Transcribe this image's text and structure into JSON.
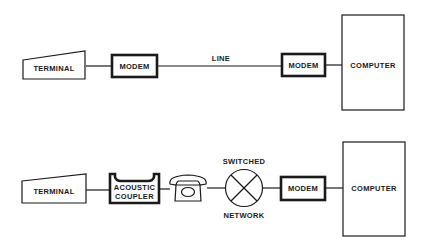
{
  "diagram": {
    "top_row": {
      "terminal": {
        "label": "TERMINAL"
      },
      "modem_left": {
        "label": "MODEM"
      },
      "line": {
        "label": "LINE"
      },
      "modem_right": {
        "label": "MODEM"
      },
      "computer": {
        "label": "COMPUTER"
      }
    },
    "bottom_row": {
      "terminal": {
        "label": "TERMINAL"
      },
      "acoustic_coupler": {
        "label_line1": "ACOUSTIC",
        "label_line2": "COUPLER"
      },
      "telephone": {
        "icon": "telephone-icon"
      },
      "switched_network": {
        "label_top": "SWITCHED",
        "label_bottom": "NETWORK",
        "icon": "circle-x-icon"
      },
      "modem": {
        "label": "MODEM"
      },
      "computer": {
        "label": "COMPUTER"
      }
    },
    "colors": {
      "ink": "#1a1a1a",
      "background": "#ffffff"
    }
  }
}
